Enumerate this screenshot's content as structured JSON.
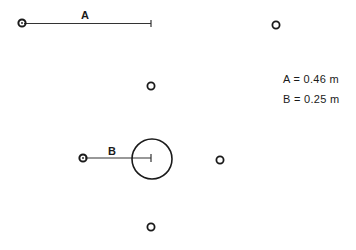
{
  "diagram": {
    "labels": {
      "a": "A",
      "b": "B"
    },
    "legend": [
      {
        "text": "A = 0.46 m"
      },
      {
        "text": "B = 0.25 m"
      }
    ],
    "colors": {
      "stroke": "#1a1a1a",
      "background": "#ffffff"
    }
  }
}
